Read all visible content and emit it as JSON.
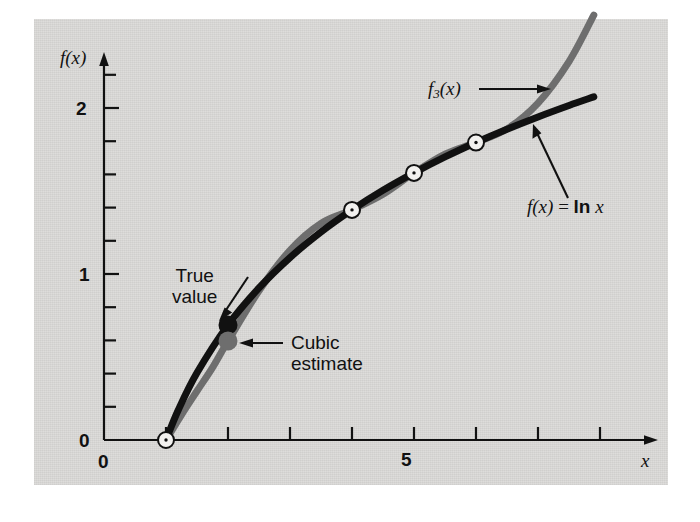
{
  "figure": {
    "background_color": "#dcdbd9",
    "page_color": "#ffffff",
    "true_curve_color": "#111111",
    "interp_curve_color": "#6e6e6e"
  },
  "axes": {
    "y_axis_label": "f(x)",
    "x_axis_label": "x",
    "y_tick_labels": [
      "0",
      "1",
      "2"
    ],
    "y_tick_values": [
      0,
      1,
      2
    ],
    "x_tick_labels": [
      "0",
      "5"
    ],
    "x_tick_values": [
      0,
      5
    ],
    "x_origin_label": "0",
    "y_origin_label": "0"
  },
  "annotations": {
    "interp_label": "f",
    "interp_label_sub": "3",
    "interp_label_tail": "(x)",
    "true_label_lead": "f(x)",
    "true_label_eq": " = ",
    "true_label_fn": "ln",
    "true_label_arg": " x",
    "true_value_line1": "True",
    "true_value_line2": "value",
    "cubic_line1": "Cubic",
    "cubic_line2": "estimate"
  },
  "chart_data": {
    "type": "line",
    "title": "",
    "xlabel": "x",
    "ylabel": "f(x)",
    "xlim": [
      0,
      9
    ],
    "ylim": [
      0,
      2.35
    ],
    "grid": false,
    "legend": "annotations",
    "x_ticks": [
      0,
      1,
      2,
      3,
      4,
      5,
      6,
      7,
      8
    ],
    "x_tick_labels_shown": {
      "0": "0",
      "5": "5"
    },
    "y_ticks": [
      0,
      0.2,
      0.4,
      0.6,
      0.8,
      1.0,
      1.2,
      1.4,
      1.6,
      1.8,
      2.0,
      2.2
    ],
    "y_tick_labels_shown": {
      "0": "0",
      "1": "1",
      "2": "2"
    },
    "series": [
      {
        "name": "f(x) = ln x",
        "color": "#111111",
        "style": "solid-thick",
        "x": [
          1.0,
          1.2,
          1.5,
          2.0,
          2.5,
          3.0,
          3.5,
          4.0,
          4.5,
          5.0,
          5.5,
          6.0,
          6.5,
          7.0,
          7.5,
          7.9
        ],
        "y": [
          0.0,
          0.182,
          0.405,
          0.693,
          0.916,
          1.099,
          1.253,
          1.386,
          1.504,
          1.609,
          1.705,
          1.792,
          1.872,
          1.946,
          2.015,
          2.067
        ]
      },
      {
        "name": "f3(x)",
        "color": "#6e6e6e",
        "style": "solid-thick",
        "x": [
          1.0,
          1.25,
          1.5,
          1.75,
          2.0,
          2.5,
          3.0,
          3.5,
          4.0,
          4.5,
          5.0,
          5.5,
          6.0,
          6.5,
          7.0,
          7.5,
          7.9
        ],
        "y": [
          0.0,
          0.152,
          0.295,
          0.436,
          0.596,
          0.899,
          1.143,
          1.305,
          1.386,
          1.48,
          1.609,
          1.722,
          1.792,
          1.874,
          2.03,
          2.28,
          2.56
        ]
      }
    ],
    "interpolation_nodes": {
      "marker": "open-circle",
      "x": [
        1,
        4,
        5,
        6
      ],
      "y": [
        0.0,
        1.386,
        1.609,
        1.792
      ]
    },
    "highlight_points": [
      {
        "label": "True value",
        "x": 2,
        "y": 0.693,
        "marker": "filled-circle",
        "color": "#111111"
      },
      {
        "label": "Cubic estimate",
        "x": 2,
        "y": 0.596,
        "marker": "filled-circle",
        "color": "#6e6e6e"
      }
    ]
  }
}
